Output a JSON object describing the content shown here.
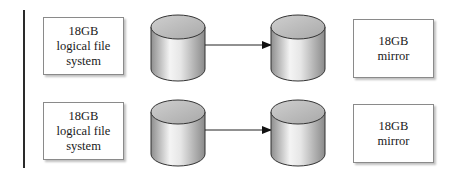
{
  "diagram": {
    "type": "disk-mirroring",
    "rows": [
      {
        "source": {
          "lines": [
            "18GB",
            "logical file",
            "system"
          ]
        },
        "target": {
          "lines": [
            "18GB",
            "mirror"
          ]
        }
      },
      {
        "source": {
          "lines": [
            "18GB",
            "logical file",
            "system"
          ]
        },
        "target": {
          "lines": [
            "18GB",
            "mirror"
          ]
        }
      }
    ],
    "icons": {
      "disk": "cylinder-disk-icon",
      "arrow": "arrow-right-icon"
    },
    "colors": {
      "line": "#2a2a2a",
      "box_border": "#8a8a8a",
      "cylinder_light": "#f2f2f2",
      "cylinder_dark": "#8c8c8c"
    }
  }
}
